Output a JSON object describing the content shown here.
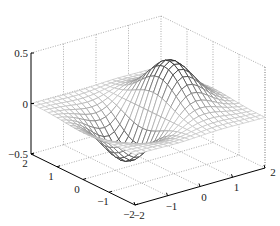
{
  "chart_data": {
    "type": "surface",
    "title": "",
    "function": "z = x * exp(-x^2 - y^2)",
    "xlabel": "",
    "ylabel": "",
    "zlabel": "",
    "x_range": [
      -2,
      2
    ],
    "y_range": [
      -2,
      2
    ],
    "zlim": [
      -0.5,
      0.5
    ],
    "grid_step": 0.1667,
    "grid": true,
    "colormap": "gray (darker where |z| larger)",
    "z_ticks": [
      "0.5",
      "0",
      "-0.5"
    ],
    "left_axis_ticks": [
      "2",
      "1",
      "0",
      "−1",
      "−2"
    ],
    "right_axis_ticks": [
      "−2",
      "−1",
      "0",
      "1",
      "2"
    ],
    "z_tick_labels_display": [
      "0.5",
      "0",
      "−0.5"
    ],
    "peak": {
      "x": 0.707,
      "y": 0,
      "z": 0.429
    },
    "trough": {
      "x": -0.707,
      "y": 0,
      "z": -0.429
    }
  },
  "axes": {
    "z_ticks": [
      {
        "label": "0.5",
        "value": 0.5
      },
      {
        "label": "0",
        "value": 0
      },
      {
        "label": "−0.5",
        "value": -0.5
      }
    ],
    "left_ticks": [
      {
        "label": "2",
        "value": 2
      },
      {
        "label": "1",
        "value": 1
      },
      {
        "label": "0",
        "value": 0
      },
      {
        "label": "−1",
        "value": -1
      },
      {
        "label": "−2",
        "value": -2
      }
    ],
    "right_ticks": [
      {
        "label": "−2",
        "value": -2
      },
      {
        "label": "−1",
        "value": -1
      },
      {
        "label": "0",
        "value": 0
      },
      {
        "label": "1",
        "value": 1
      },
      {
        "label": "2",
        "value": 2
      }
    ]
  },
  "projection": {
    "front": [
      135,
      205
    ],
    "a_vec": [
      130,
      -37
    ],
    "b_vec": [
      -104,
      -51
    ],
    "z_scale": 101,
    "z_offset": 50.5
  }
}
